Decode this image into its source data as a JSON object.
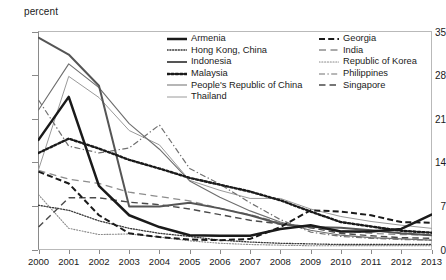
{
  "chart_data": {
    "type": "line",
    "title": "",
    "xlabel": "",
    "ylabel": "percent",
    "ylim": [
      0,
      35
    ],
    "yticks": [
      0,
      7,
      14,
      21,
      28,
      35
    ],
    "grid": false,
    "legend_position": "inside-top-right",
    "categories": [
      "2000",
      "2001",
      "2002",
      "2003",
      "2004",
      "2005",
      "2006",
      "2007",
      "2008",
      "2009",
      "2010",
      "2011",
      "2012",
      "2013"
    ],
    "x": [
      2000,
      2001,
      2002,
      2003,
      2004,
      2005,
      2006,
      2007,
      2008,
      2009,
      2010,
      2011,
      2012,
      2013
    ],
    "series": [
      {
        "name": "Armenia",
        "style": "solid-thick-black",
        "color": "#1a1a1a",
        "values": [
          17.6,
          24.5,
          10.2,
          5.5,
          3.6,
          2.3,
          2.2,
          2.2,
          3.3,
          3.9,
          2.9,
          2.9,
          3.3,
          5.6
        ]
      },
      {
        "name": "Hong Kong, China",
        "style": "fine-dotted",
        "color": "#3a3a3a",
        "values": [
          7.1,
          6.3,
          4.6,
          3.4,
          2.6,
          2.1,
          1.5,
          1.2,
          1.0,
          0.9,
          0.8,
          0.8,
          0.8,
          0.8
        ]
      },
      {
        "name": "Indonesia",
        "style": "solid-medium-dark",
        "color": "#555555",
        "values": [
          34.0,
          31.3,
          26.3,
          6.9,
          6.9,
          7.5,
          6.6,
          5.5,
          4.1,
          3.6,
          3.5,
          3.1,
          2.6,
          2.3
        ]
      },
      {
        "name": "Malaysia",
        "style": "thick-dotted",
        "color": "#1a1a1a",
        "values": [
          15.5,
          17.8,
          16.2,
          14.4,
          13.0,
          11.5,
          10.4,
          9.3,
          7.9,
          6.1,
          4.4,
          3.7,
          3.0,
          2.7
        ]
      },
      {
        "name": "People's Republic of China",
        "style": "solid-thin-gray",
        "color": "#6e6e6e",
        "values": [
          22.4,
          29.8,
          26.0,
          20.2,
          16.1,
          11.0,
          8.4,
          6.2,
          4.4,
          3.1,
          2.3,
          1.9,
          1.7,
          1.5
        ]
      },
      {
        "name": "Thailand",
        "style": "solid-thin-lightgray",
        "color": "#9a9a9a",
        "values": [
          12.8,
          27.8,
          24.4,
          19.1,
          16.8,
          11.1,
          9.5,
          8.2,
          8.2,
          6.5,
          5.3,
          4.5,
          3.9,
          3.4
        ]
      },
      {
        "name": "Georgia",
        "style": "bold-dashed",
        "color": "#1a1a1a",
        "values": [
          12.5,
          10.6,
          5.5,
          2.6,
          2.0,
          1.6,
          1.5,
          1.7,
          3.6,
          6.3,
          6.1,
          5.5,
          4.4,
          4.3
        ]
      },
      {
        "name": "India",
        "style": "long-dash-gray",
        "color": "#8d8d8d",
        "values": [
          12.7,
          11.3,
          10.6,
          9.2,
          8.5,
          7.8,
          6.6,
          5.6,
          4.3,
          3.5,
          3.0,
          2.6,
          2.4,
          2.3
        ]
      },
      {
        "name": "Republic of Korea",
        "style": "fine-dotted-light",
        "color": "#8a8a8a",
        "values": [
          8.8,
          3.4,
          2.4,
          2.5,
          2.0,
          1.4,
          1.0,
          0.8,
          0.7,
          0.6,
          0.6,
          0.6,
          0.6,
          0.6
        ]
      },
      {
        "name": "Philippines",
        "style": "dash-dot",
        "color": "#707070",
        "values": [
          24.0,
          16.6,
          15.5,
          16.3,
          20.0,
          13.0,
          10.5,
          7.5,
          4.8,
          2.8,
          2.1,
          1.8,
          1.6,
          1.5
        ]
      },
      {
        "name": "Singapore",
        "style": "long-dash-dark",
        "color": "#4a4a4a",
        "values": [
          3.6,
          8.3,
          8.3,
          7.6,
          7.2,
          6.5,
          5.6,
          4.7,
          4.1,
          3.5,
          2.6,
          2.2,
          1.9,
          1.8
        ]
      }
    ]
  },
  "axis": {
    "y_label": "percent",
    "y_ticks": [
      "35",
      "28",
      "21",
      "14",
      "7",
      "0"
    ],
    "x_ticks": [
      "2000",
      "2001",
      "2002",
      "2003",
      "2004",
      "2005",
      "2006",
      "2007",
      "2008",
      "2009",
      "2010",
      "2011",
      "2012",
      "2013"
    ]
  },
  "legend": {
    "left_column": [
      {
        "label": "Armenia",
        "swatch": "solid-thick-black"
      },
      {
        "label": "Hong Kong, China",
        "swatch": "fine-dotted"
      },
      {
        "label": "Indonesia",
        "swatch": "solid-medium-dark"
      },
      {
        "label": "Malaysia",
        "swatch": "thick-dotted"
      },
      {
        "label": "People's Republic of China",
        "swatch": "solid-thin-gray"
      },
      {
        "label": "Thailand",
        "swatch": "solid-thin-lightgray"
      }
    ],
    "right_column": [
      {
        "label": "Georgia",
        "swatch": "bold-dashed"
      },
      {
        "label": "India",
        "swatch": "long-dash-gray"
      },
      {
        "label": "Republic of Korea",
        "swatch": "fine-dotted-light"
      },
      {
        "label": "Philippines",
        "swatch": "dash-dot"
      },
      {
        "label": "Singapore",
        "swatch": "long-dash-dark"
      }
    ]
  },
  "colors": {
    "background": "#ffffff",
    "frame": "#b9b9b9",
    "text": "#1a1a1a"
  }
}
